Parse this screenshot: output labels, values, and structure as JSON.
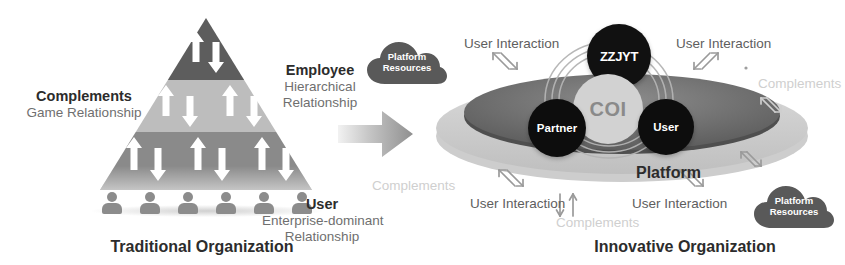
{
  "left_panel": {
    "title": "Traditional Organization",
    "pyramid": {
      "tiers": [
        {
          "name": "top",
          "arrow_count": 2,
          "color": "#5d5d5d"
        },
        {
          "name": "middle",
          "arrow_count": 4,
          "color": "#bdbdbd"
        },
        {
          "name": "bottom",
          "arrow_count": 6,
          "color": "#8a8a8a"
        }
      ],
      "people_count": 6
    },
    "complements": {
      "heading": "Complements",
      "subtitle": "Game Relationship"
    },
    "employee": {
      "heading": "Employee",
      "line1": "Hierarchical",
      "line2": "Relationship"
    },
    "user": {
      "heading": "User",
      "line1": "Enterprise-dominant",
      "line2": "Relationship"
    }
  },
  "transition": {
    "icon": "right-arrow-icon"
  },
  "right_panel": {
    "title": "Innovative Organization",
    "platform_label": "Platform",
    "nodes": [
      {
        "id": "zzjyt",
        "label": "ZZJYT",
        "color": "#111111"
      },
      {
        "id": "coi",
        "label": "COI",
        "color": "#d2d2d2"
      },
      {
        "id": "partner",
        "label": "Partner",
        "color": "#0d0d0d"
      },
      {
        "id": "user",
        "label": "User",
        "color": "#0d0d0d"
      }
    ],
    "clouds": [
      {
        "id": "top-left",
        "line1": "Platform",
        "line2": "Resources"
      },
      {
        "id": "bottom-right",
        "line1": "Platform",
        "line2": "Resources"
      }
    ],
    "interaction_labels": {
      "top_left": "User Interaction",
      "top_right": "User Interaction",
      "bottom_left": "User Interaction",
      "bottom_right": "User Interaction"
    },
    "complements_labels": {
      "right": "Complements",
      "left": "Complements",
      "bottom": "Complements"
    }
  },
  "colors": {
    "pyramid_top": "#5d5d5d",
    "pyramid_middle": "#bdbdbd",
    "pyramid_bottom": "#8a8a8a",
    "platform_disc": "#6b6b6b",
    "platform_rim": "#c4c4c4",
    "node_dark": "#111111",
    "coi": "#d2d2d2",
    "cloud": "#595959",
    "text_dark": "#2c2c2c",
    "text_mid": "#6f6f6f",
    "text_light": "#cfcfcf"
  }
}
